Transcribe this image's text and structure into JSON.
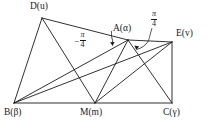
{
  "figure": {
    "type": "geometry-diagram",
    "vertices": [
      {
        "id": "D",
        "label": "D",
        "param": "u",
        "text": "D(u)",
        "x": 42,
        "y": 18,
        "label_x": 30,
        "label_y": 2
      },
      {
        "id": "A",
        "label": "A",
        "param": "α",
        "text": "A(α)",
        "x": 128,
        "y": 40,
        "label_x": 113,
        "label_y": 24
      },
      {
        "id": "E",
        "label": "E",
        "param": "v",
        "text": "E(v)",
        "x": 172,
        "y": 42,
        "label_x": 176,
        "label_y": 29
      },
      {
        "id": "B",
        "label": "B",
        "param": "β",
        "text": "B(β)",
        "x": 14,
        "y": 103,
        "label_x": 4,
        "label_y": 108
      },
      {
        "id": "M",
        "label": "M",
        "param": "m",
        "text": "M(m)",
        "x": 95,
        "y": 103,
        "label_x": 80,
        "label_y": 108
      },
      {
        "id": "C",
        "label": "C",
        "param": "γ",
        "text": "C(γ)",
        "x": 172,
        "y": 103,
        "label_x": 163,
        "label_y": 108
      }
    ],
    "segments": [
      {
        "name": "B-C",
        "from": "B",
        "to": "C"
      },
      {
        "name": "B-D",
        "from": "B",
        "to": "D"
      },
      {
        "name": "D-A",
        "from": "D",
        "to": "A"
      },
      {
        "name": "D-M",
        "from": "D",
        "to": "M"
      },
      {
        "name": "B-A",
        "from": "B",
        "to": "A"
      },
      {
        "name": "B-E",
        "from": "B",
        "to": "E"
      },
      {
        "name": "M-A",
        "from": "M",
        "to": "A"
      },
      {
        "name": "M-E",
        "from": "M",
        "to": "E"
      },
      {
        "name": "A-C",
        "from": "A",
        "to": "C"
      },
      {
        "name": "A-E",
        "from": "A",
        "to": "E"
      },
      {
        "name": "C-E",
        "from": "C",
        "to": "E"
      }
    ],
    "angles": [
      {
        "id": "angle-left",
        "value": "−π/4",
        "sign": "−",
        "numerator": "π",
        "denominator": "4",
        "label_x": 74,
        "label_y": 34,
        "vertex": "A"
      },
      {
        "id": "angle-right",
        "value": "π/4",
        "sign": "",
        "numerator": "π",
        "denominator": "4",
        "label_x": 151,
        "label_y": 13,
        "vertex": "A"
      }
    ],
    "stroke_color": "#1a1a1a",
    "background_color": "#ffffff"
  }
}
